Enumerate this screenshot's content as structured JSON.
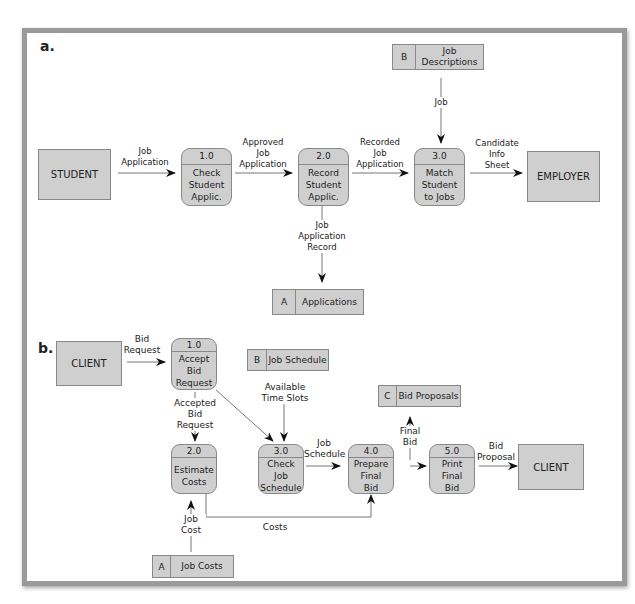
{
  "diagram_a": {
    "section_label": "a.",
    "entities": {
      "student": "STUDENT",
      "employer": "EMPLOYER"
    },
    "processes": [
      {
        "id": "1.0",
        "name": "Check\nStudent\nApplic."
      },
      {
        "id": "2.0",
        "name": "Record\nStudent\nApplic."
      },
      {
        "id": "3.0",
        "name": "Match\nStudent\nto Jobs"
      }
    ],
    "stores": [
      {
        "id": "B",
        "name": "Job\nDescriptions"
      },
      {
        "id": "A",
        "name": "Applications"
      }
    ],
    "flows": {
      "job_application": "Job\nApplication",
      "approved": "Approved\nJob\nApplication",
      "recorded": "Recorded\nJob\nApplication",
      "candidate": "Candidate\nInfo\nSheet",
      "job": "Job",
      "record": "Job\nApplication\nRecord"
    }
  },
  "diagram_b": {
    "section_label": "b.",
    "entities": {
      "client_left": "CLIENT",
      "client_right": "CLIENT"
    },
    "processes": [
      {
        "id": "1.0",
        "name": "Accept\nBid\nRequest"
      },
      {
        "id": "2.0",
        "name": "Estimate\nCosts"
      },
      {
        "id": "3.0",
        "name": "Check\nJob\nSchedule"
      },
      {
        "id": "4.0",
        "name": "Prepare\nFinal\nBid"
      },
      {
        "id": "5.0",
        "name": "Print\nFinal\nBid"
      }
    ],
    "stores": [
      {
        "id": "B",
        "name": "Job Schedule"
      },
      {
        "id": "C",
        "name": "Bid Proposals"
      },
      {
        "id": "A",
        "name": "Job Costs"
      }
    ],
    "flows": {
      "bid_request": "Bid\nRequest",
      "accepted": "Accepted\nBid\nRequest",
      "slots": "Available\nTime Slots",
      "schedule": "Job\nSchedule",
      "final_bid": "Final\nBid",
      "proposal": "Bid\nProposal",
      "costs": "Costs",
      "job_cost": "Job\nCost"
    }
  }
}
